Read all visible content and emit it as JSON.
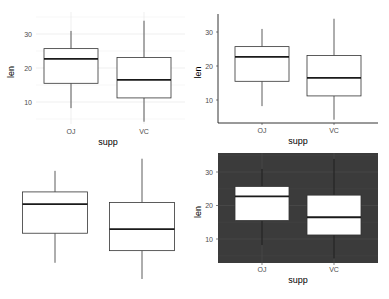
{
  "chart_data": [
    {
      "id": "panel-minimal",
      "type": "boxplot",
      "theme": "minimal",
      "title": "",
      "xlabel": "supp",
      "ylabel": "len",
      "categories": [
        "OJ",
        "VC"
      ],
      "yticks": [
        10,
        20,
        30
      ],
      "ylim": [
        3,
        35
      ],
      "grid": true,
      "boxes": [
        {
          "category": "OJ",
          "whisker_low": 8.2,
          "q1": 15.5,
          "median": 22.7,
          "q3": 25.7,
          "whisker_high": 30.9
        },
        {
          "category": "VC",
          "whisker_low": 4.2,
          "q1": 11.2,
          "median": 16.5,
          "q3": 23.1,
          "whisker_high": 33.9
        }
      ]
    },
    {
      "id": "panel-classic",
      "type": "boxplot",
      "theme": "classic",
      "title": "",
      "xlabel": "supp",
      "ylabel": "len",
      "categories": [
        "OJ",
        "VC"
      ],
      "yticks": [
        10,
        20,
        30
      ],
      "ylim": [
        3,
        35
      ],
      "grid": false,
      "boxes": [
        {
          "category": "OJ",
          "whisker_low": 8.2,
          "q1": 15.5,
          "median": 22.7,
          "q3": 25.7,
          "whisker_high": 30.9
        },
        {
          "category": "VC",
          "whisker_low": 4.2,
          "q1": 11.2,
          "median": 16.5,
          "q3": 23.1,
          "whisker_high": 33.9
        }
      ]
    },
    {
      "id": "panel-void",
      "type": "boxplot",
      "theme": "void",
      "title": "",
      "xlabel": "",
      "ylabel": "",
      "categories": [
        "OJ",
        "VC"
      ],
      "yticks": [],
      "ylim": [
        3,
        35
      ],
      "grid": false,
      "boxes": [
        {
          "category": "OJ",
          "whisker_low": 8.2,
          "q1": 15.5,
          "median": 22.7,
          "q3": 25.7,
          "whisker_high": 30.9
        },
        {
          "category": "VC",
          "whisker_low": 4.2,
          "q1": 11.2,
          "median": 16.5,
          "q3": 23.1,
          "whisker_high": 33.9
        }
      ]
    },
    {
      "id": "panel-dark",
      "type": "boxplot",
      "theme": "dark",
      "title": "",
      "xlabel": "supp",
      "ylabel": "len",
      "categories": [
        "OJ",
        "VC"
      ],
      "yticks": [
        10,
        20,
        30
      ],
      "ylim": [
        3,
        35
      ],
      "grid": true,
      "boxes": [
        {
          "category": "OJ",
          "whisker_low": 8.2,
          "q1": 15.5,
          "median": 22.7,
          "q3": 25.7,
          "whisker_high": 30.9
        },
        {
          "category": "VC",
          "whisker_low": 4.2,
          "q1": 11.2,
          "median": 16.5,
          "q3": 23.1,
          "whisker_high": 33.9
        }
      ]
    }
  ],
  "colors": {
    "box_fill": "#ffffff",
    "box_stroke": "#333333",
    "dark_panel": "#3b3b3b",
    "dark_grid": "#4a4a4a",
    "minimal_grid": "#ebebeb",
    "axis_line": "#000000",
    "tick_text": "#4d4d4d"
  }
}
